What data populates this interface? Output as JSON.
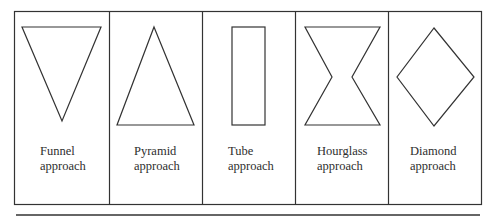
{
  "figure": {
    "line_color": "#333333",
    "panels": [
      {
        "id": "funnel",
        "line1": "Funnel",
        "line2": "approach",
        "shape": "inverted-triangle"
      },
      {
        "id": "pyramid",
        "line1": "Pyramid",
        "line2": "approach",
        "shape": "triangle"
      },
      {
        "id": "tube",
        "line1": "Tube",
        "line2": "approach",
        "shape": "rectangle"
      },
      {
        "id": "hourglass",
        "line1": "Hourglass",
        "line2": "approach",
        "shape": "hourglass"
      },
      {
        "id": "diamond",
        "line1": "Diamond",
        "line2": "approach",
        "shape": "diamond"
      }
    ]
  }
}
